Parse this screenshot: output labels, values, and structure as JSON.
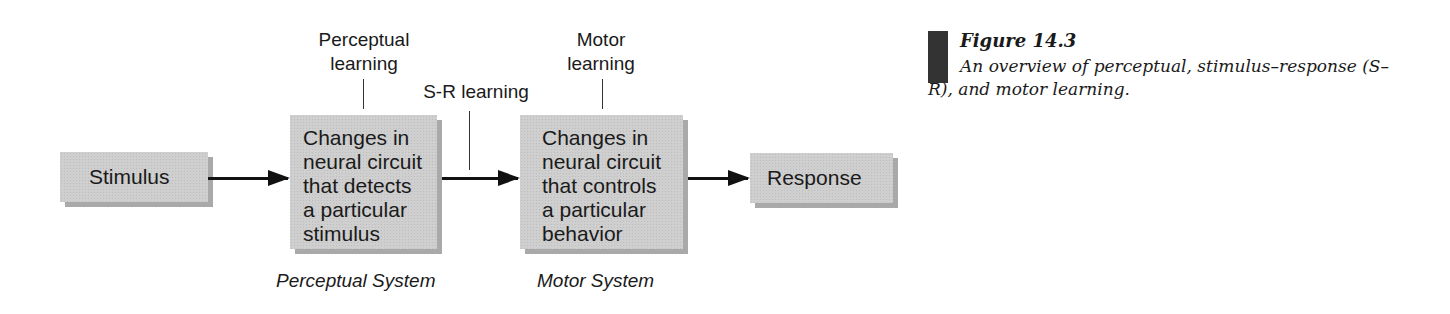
{
  "diagram": {
    "nodes": {
      "stimulus": "Stimulus",
      "perceptual": [
        "Changes in",
        "neural circuit",
        "that detects",
        "a particular",
        "stimulus"
      ],
      "motor": [
        "Changes in",
        "neural circuit",
        "that controls",
        "a particular",
        "behavior"
      ],
      "response": "Response"
    },
    "annotations": {
      "perceptual_learning": [
        "Perceptual",
        "learning"
      ],
      "sr_learning": "S-R learning",
      "motor_learning": [
        "Motor",
        "learning"
      ]
    },
    "systems": {
      "perceptual": "Perceptual System",
      "motor": "Motor System"
    }
  },
  "caption": {
    "title": "Figure 14.3",
    "text": "An overview of perceptual, stimulus–response (S–R), and motor learning."
  }
}
